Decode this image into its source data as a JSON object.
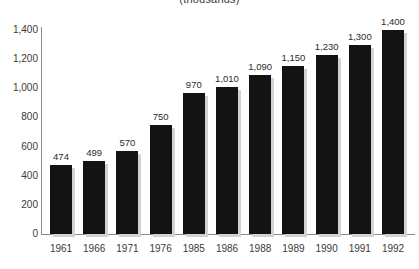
{
  "chart_data": {
    "type": "bar",
    "title": "(thousands)",
    "subtitle": "",
    "xlabel": "",
    "ylabel": "",
    "categories": [
      "1961",
      "1966",
      "1971",
      "1976",
      "1985",
      "1986",
      "1988",
      "1989",
      "1990",
      "1991",
      "1992"
    ],
    "values": [
      474,
      499,
      570,
      750,
      970,
      1010,
      1090,
      1150,
      1230,
      1300,
      1400
    ],
    "value_labels": [
      "474",
      "499",
      "570",
      "750",
      "970",
      "1,010",
      "1,090",
      "1,150",
      "1,230",
      "1,300",
      "1,400"
    ],
    "ylim": [
      0,
      1400
    ],
    "y_ticks": [
      0,
      200,
      400,
      600,
      800,
      1000,
      1200,
      1400
    ],
    "y_tick_labels": [
      "0",
      "200",
      "400",
      "600",
      "800",
      "1,000",
      "1,200",
      "1,400"
    ],
    "grid": false,
    "legend": false,
    "legend_position": "none",
    "bar_color": "#131313",
    "axis_color": "#8c8c8c",
    "text_color": "#3a3a3a",
    "background_color": "#ffffff"
  }
}
